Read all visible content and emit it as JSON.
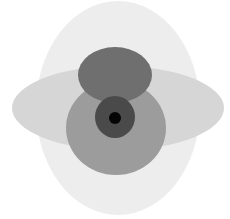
{
  "canvas": {
    "width": 230,
    "height": 219,
    "background": "#ffffff"
  },
  "shapes": [
    {
      "name": "outer-tall-ellipse",
      "cx": 118,
      "cy": 108,
      "rx": 82,
      "ry": 107,
      "fill": "#ededed"
    },
    {
      "name": "wide-horizontal-ellipse",
      "cx": 118,
      "cy": 108,
      "rx": 106,
      "ry": 42,
      "fill": "#d6d6d6"
    },
    {
      "name": "large-medium-circle",
      "cx": 116,
      "cy": 128,
      "rx": 50,
      "ry": 47,
      "fill": "#9c9c9c"
    },
    {
      "name": "upper-dark-ellipse",
      "cx": 115,
      "cy": 75,
      "rx": 37,
      "ry": 28,
      "fill": "#6f6f6f"
    },
    {
      "name": "inner-dark-circle",
      "cx": 115,
      "cy": 117,
      "rx": 20,
      "ry": 21,
      "fill": "#4a4a4a"
    },
    {
      "name": "center-black-dot",
      "cx": 115,
      "cy": 118,
      "rx": 6,
      "ry": 6,
      "fill": "#050505"
    }
  ]
}
